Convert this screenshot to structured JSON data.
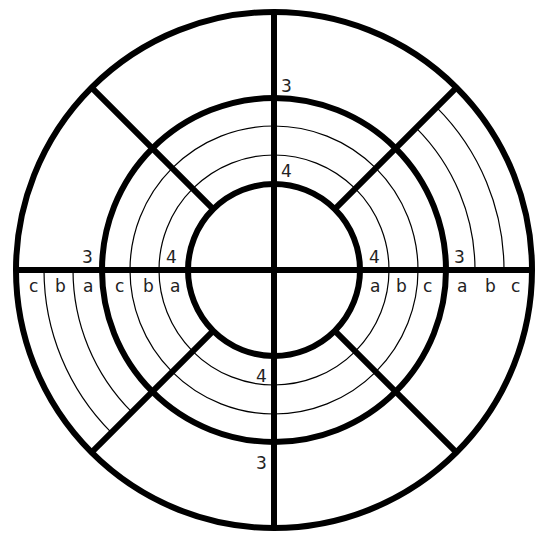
{
  "diagram": {
    "type": "concentric-ring-diagram",
    "center": [
      274,
      270
    ],
    "colors": {
      "line": "#000000",
      "background": "#ffffff",
      "label": "#222222"
    },
    "rings": {
      "outer_radius": 258,
      "middle_radius": 172,
      "inner_radius": 86
    },
    "ring_labels": {
      "outer_band": "3",
      "inner_band": "4"
    },
    "thin_arcs": {
      "inner_band_radii": [
        115,
        144
      ],
      "outer_band_radii": [
        201,
        230
      ],
      "outer_band_quadrants": [
        "top-right",
        "bottom-left"
      ]
    },
    "sublabels": {
      "left": [
        "c",
        "b",
        "a",
        "c",
        "b",
        "a"
      ],
      "right": [
        "a",
        "b",
        "c",
        "a",
        "b",
        "c"
      ]
    },
    "labels": {
      "top_3": "3",
      "top_4": "4",
      "bottom_4": "4",
      "bottom_3": "3",
      "left_3": "3",
      "left_4": "4",
      "right_4": "4",
      "right_3": "3",
      "l1": "c",
      "l2": "b",
      "l3": "a",
      "l4": "c",
      "l5": "b",
      "l6": "a",
      "r1": "a",
      "r2": "b",
      "r3": "c",
      "r4": "a",
      "r5": "b",
      "r6": "c"
    }
  }
}
